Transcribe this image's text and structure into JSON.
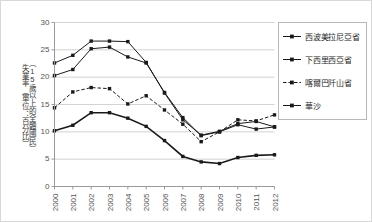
{
  "chart_data": {
    "type": "line",
    "title": "",
    "xlabel": "",
    "ylabel": "失業率（單位：百分比）（15歲以上的全體國民）",
    "ylabel_col1": "失業率（單位：百分比）",
    "ylabel_col2": "（15歲以上的全體國民）",
    "categories": [
      "2000",
      "2001",
      "2002",
      "2003",
      "2004",
      "2005",
      "2006",
      "2007",
      "2008",
      "2009",
      "2010",
      "2011",
      "2012"
    ],
    "xlim": [
      2000,
      2012
    ],
    "ylim": [
      0,
      30
    ],
    "yticks": [
      0,
      5,
      10,
      15,
      20,
      25,
      30
    ],
    "grid": true,
    "legend_position": "right",
    "series": [
      {
        "name": "西波美拉尼亞省",
        "line_style": "solid",
        "marker": "square",
        "color": "#1a1a1a",
        "values": [
          20.3,
          21.4,
          25.2,
          25.5,
          23.7,
          22.6,
          17.2,
          12.6,
          9.3,
          10.0,
          11.3,
          10.5,
          10.9
        ]
      },
      {
        "name": "下西里西亞省",
        "line_style": "solid",
        "marker": "square",
        "color": "#1a1a1a",
        "values": [
          22.6,
          24.0,
          26.6,
          26.6,
          26.5,
          22.7,
          17.1,
          12.2,
          9.4,
          10.1,
          11.5,
          11.9,
          10.9
        ]
      },
      {
        "name": "喀爾巴阡山省",
        "line_style": "dashed",
        "marker": "square",
        "color": "#1a1a1a",
        "values": [
          14.4,
          17.3,
          18.1,
          17.9,
          15.1,
          16.6,
          14.0,
          11.4,
          8.2,
          10.0,
          12.2,
          12.0,
          13.1
        ]
      },
      {
        "name": "華沙",
        "line_style": "solid",
        "marker": "square",
        "color": "#1a1a1a",
        "values": [
          10.2,
          11.2,
          13.5,
          13.5,
          12.5,
          11.0,
          8.4,
          5.5,
          4.5,
          4.2,
          5.3,
          5.7,
          5.8
        ]
      }
    ]
  }
}
